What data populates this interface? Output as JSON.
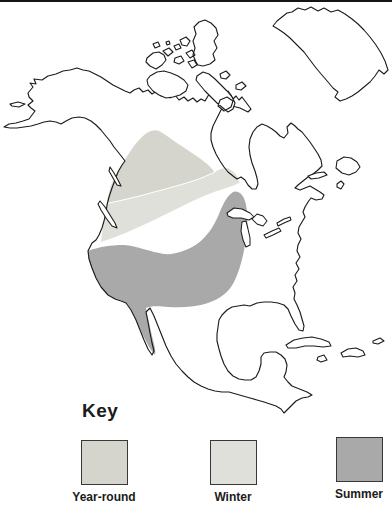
{
  "map": {
    "name": "North America bird range map",
    "outline_color": "#1c1c1c",
    "regions": [
      {
        "id": "year-round",
        "label": "Year-round",
        "color": "#d5d5ce"
      },
      {
        "id": "winter",
        "label": "Winter",
        "color": "#e0e0da"
      },
      {
        "id": "summer",
        "label": "Summer",
        "color": "#a9a9a9"
      }
    ]
  },
  "key": {
    "title": "Key",
    "items": [
      {
        "label": "Year-round",
        "color": "#d5d5ce"
      },
      {
        "label": "Winter",
        "color": "#e0e0da"
      },
      {
        "label": "Summer",
        "color": "#a9a9a9"
      }
    ]
  }
}
